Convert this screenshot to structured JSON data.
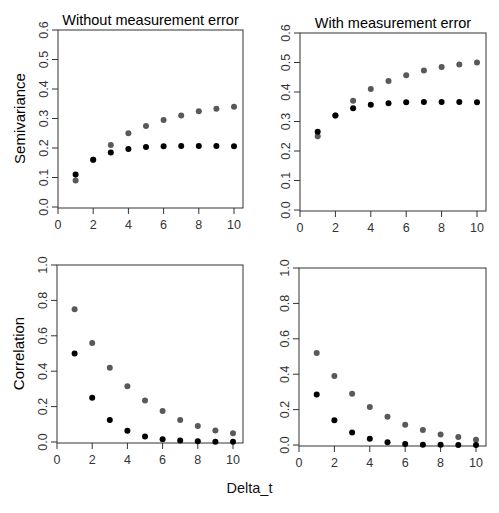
{
  "figure": {
    "xlabel": "Delta_t",
    "colors": {
      "series_gray": "#595959",
      "series_black": "#000000"
    }
  },
  "chart_data": [
    {
      "type": "scatter",
      "title": "Without measurement error",
      "xlabel": "",
      "ylabel": "Semivariance",
      "xlim": [
        0,
        10
      ],
      "ylim": [
        0,
        0.6
      ],
      "xticks": [
        "0",
        "2",
        "4",
        "6",
        "8",
        "10"
      ],
      "yticks": [
        "0.0",
        "0.1",
        "0.2",
        "0.3",
        "0.4",
        "0.5",
        "0.6"
      ],
      "grid": false,
      "x": [
        1,
        2,
        3,
        4,
        5,
        6,
        7,
        8,
        9,
        10
      ],
      "series": [
        {
          "name": "gray",
          "values": [
            0.09,
            0.16,
            0.21,
            0.25,
            0.275,
            0.295,
            0.31,
            0.325,
            0.333,
            0.34
          ]
        },
        {
          "name": "black",
          "values": [
            0.11,
            0.16,
            0.185,
            0.197,
            0.203,
            0.206,
            0.207,
            0.207,
            0.207,
            0.206
          ]
        }
      ]
    },
    {
      "type": "scatter",
      "title": "With measurement error",
      "xlabel": "",
      "ylabel": "",
      "xlim": [
        0,
        10
      ],
      "ylim": [
        0,
        0.6
      ],
      "xticks": [
        "0",
        "2",
        "4",
        "6",
        "8",
        "10"
      ],
      "yticks": [
        "0.0",
        "0.1",
        "0.2",
        "0.3",
        "0.4",
        "0.5",
        "0.6"
      ],
      "grid": false,
      "x": [
        1,
        2,
        3,
        4,
        5,
        6,
        7,
        8,
        9,
        10
      ],
      "series": [
        {
          "name": "gray",
          "values": [
            0.25,
            0.32,
            0.37,
            0.41,
            0.437,
            0.457,
            0.473,
            0.485,
            0.493,
            0.5
          ]
        },
        {
          "name": "black",
          "values": [
            0.265,
            0.32,
            0.345,
            0.357,
            0.362,
            0.365,
            0.366,
            0.366,
            0.366,
            0.365
          ]
        }
      ]
    },
    {
      "type": "scatter",
      "title": "",
      "xlabel": "",
      "ylabel": "Correlation",
      "xlim": [
        0,
        10
      ],
      "ylim": [
        0,
        1.0
      ],
      "xticks": [
        "0",
        "2",
        "4",
        "6",
        "8",
        "10"
      ],
      "yticks": [
        "0.0",
        "0.2",
        "0.4",
        "0.6",
        "0.8",
        "1.0"
      ],
      "grid": false,
      "x": [
        1,
        2,
        3,
        4,
        5,
        6,
        7,
        8,
        9,
        10
      ],
      "series": [
        {
          "name": "gray",
          "values": [
            0.75,
            0.56,
            0.42,
            0.315,
            0.235,
            0.175,
            0.125,
            0.09,
            0.065,
            0.05
          ]
        },
        {
          "name": "black",
          "values": [
            0.5,
            0.25,
            0.125,
            0.063,
            0.031,
            0.016,
            0.008,
            0.004,
            0.002,
            0.001
          ]
        }
      ]
    },
    {
      "type": "scatter",
      "title": "",
      "xlabel": "",
      "ylabel": "",
      "xlim": [
        0,
        10
      ],
      "ylim": [
        0,
        1.0
      ],
      "xticks": [
        "0",
        "2",
        "4",
        "6",
        "8",
        "10"
      ],
      "yticks": [
        "0.0",
        "0.2",
        "0.4",
        "0.6",
        "0.8",
        "1.0"
      ],
      "grid": false,
      "x": [
        1,
        2,
        3,
        4,
        5,
        6,
        7,
        8,
        9,
        10
      ],
      "series": [
        {
          "name": "gray",
          "values": [
            0.52,
            0.39,
            0.29,
            0.215,
            0.16,
            0.115,
            0.085,
            0.06,
            0.045,
            0.03
          ]
        },
        {
          "name": "black",
          "values": [
            0.285,
            0.14,
            0.07,
            0.035,
            0.015,
            0.006,
            0.002,
            0.001,
            0.0,
            0.0
          ]
        }
      ]
    }
  ]
}
